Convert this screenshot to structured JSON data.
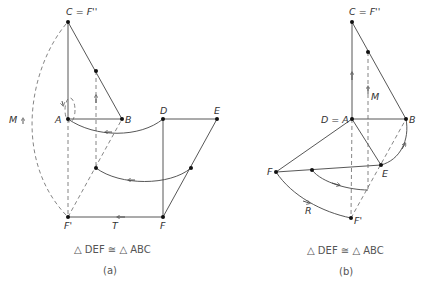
{
  "panel_a": {
    "labels": {
      "C": "C = F''",
      "A": "A",
      "B": "B",
      "D": "D",
      "E": "E",
      "F": "F",
      "F_prime": "F'",
      "M": "M",
      "T": "T"
    },
    "statement": "△ DEF ≅ △ ABC",
    "caption": "(a)"
  },
  "panel_b": {
    "labels": {
      "C": "C = F''",
      "DA": "D = A",
      "B": "B",
      "E": "E",
      "F": "F",
      "F_prime": "F'",
      "M": "M",
      "R": "R"
    },
    "statement": "△ DEF ≅ △ ABC",
    "caption": "(b)"
  }
}
